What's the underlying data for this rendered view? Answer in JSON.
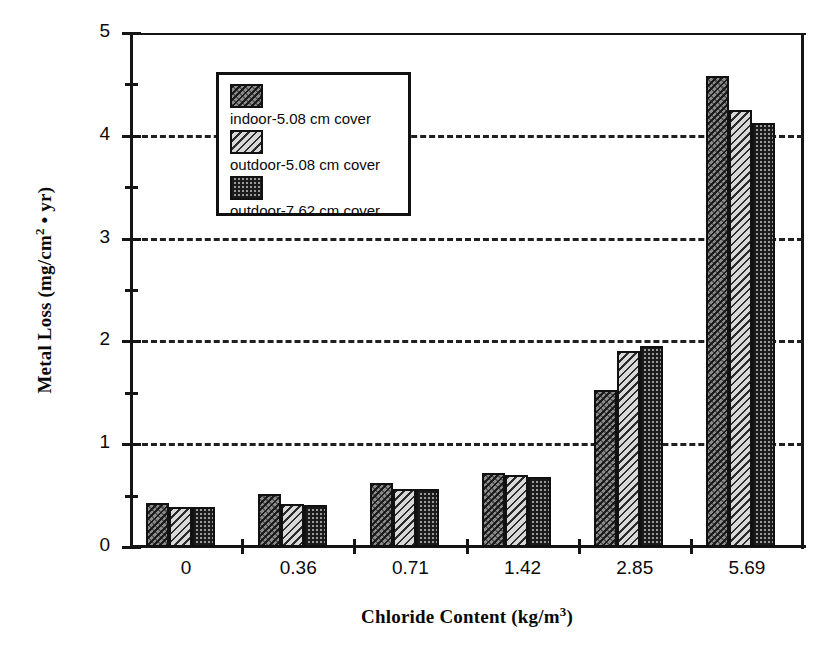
{
  "chart_data": {
    "type": "bar",
    "title": "",
    "xlabel": "Chloride Content (kg/m3)",
    "xlabel_base": "Chloride Content (kg/m",
    "xlabel_sup": "3",
    "xlabel_tail": ")",
    "ylabel": "Metal Loss (mg/cm2 • yr)",
    "ylabel_base": "Metal Loss (mg/cm",
    "ylabel_sup": "2",
    "ylabel_tail": " • yr)",
    "categories": [
      "0",
      "0.36",
      "0.71",
      "1.42",
      "2.85",
      "5.69"
    ],
    "ylim": [
      0,
      5
    ],
    "ytick_labels": [
      "0",
      "1",
      "2",
      "3",
      "4",
      "5"
    ],
    "ytick_values": [
      0,
      1,
      2,
      3,
      4,
      5
    ],
    "yminor_values": [
      0.5,
      1.5,
      2.5,
      3.5,
      4.5
    ],
    "gridline_values": [
      1,
      2,
      3,
      4
    ],
    "grid": true,
    "legend_position": "upper-left-inside",
    "series": [
      {
        "name": "indoor-5.08 cm cover",
        "pattern": "diagonal-dark",
        "values": [
          0.43,
          0.52,
          0.62,
          0.72,
          1.53,
          4.58
        ]
      },
      {
        "name": "outdoor-5.08 cm cover",
        "pattern": "diagonal-light",
        "values": [
          0.39,
          0.42,
          0.56,
          0.7,
          1.91,
          4.25
        ]
      },
      {
        "name": "outdoor-7.62 cm cover",
        "pattern": "cross-hatch",
        "values": [
          0.39,
          0.41,
          0.56,
          0.68,
          1.96,
          4.12
        ]
      }
    ]
  },
  "colors": {
    "axis": "#151515",
    "grid": "#202020",
    "text": "#0a0a0a",
    "background": "#ffffff",
    "series_a": "#8a8a8a",
    "series_b": "#d8d8d8",
    "series_c": "#9a9a9a"
  }
}
